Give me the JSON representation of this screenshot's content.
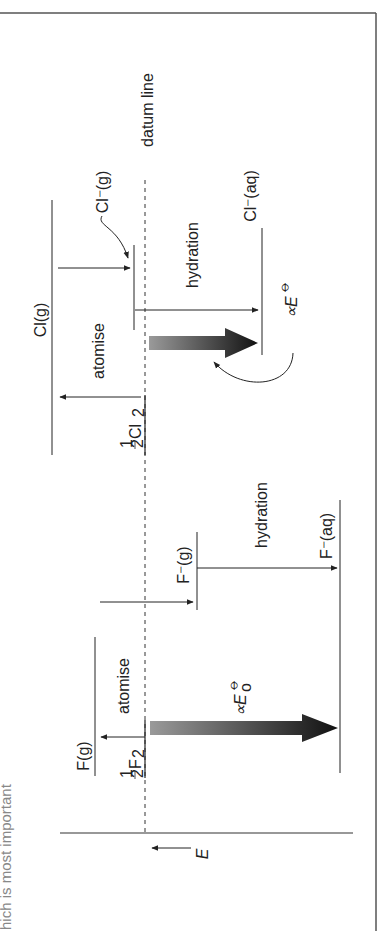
{
  "diagram": {
    "orientation": "rotated 90deg clockwise (energy axis horizontal, labels vertical)",
    "caption_fragment": "hich is most important",
    "axis": {
      "label": "E",
      "direction": "decreasing to the left"
    },
    "datum_label": "datum line",
    "chlorine": {
      "element_label": "½Cl₂",
      "element_main": "Cl",
      "element_sub": "2",
      "gas_atom": "Cl(g)",
      "gas_ion": "Cl⁻(g)",
      "aqueous_ion": "Cl⁻(aq)",
      "step_atomise": "atomise",
      "step_hydration": "hydration",
      "potential_label": "∝E",
      "potential_sup": "⦵"
    },
    "fluorine": {
      "element_label": "½F₂",
      "element_main": "F",
      "element_sub": "2",
      "gas_atom": "F(g)",
      "gas_ion": "F⁻(g)",
      "aqueous_ion": "F⁻(aq)",
      "step_atomise": "atomise",
      "step_hydration": "hydration",
      "potential_label": "∝E",
      "potential_sup": "⦵",
      "potential_sub": "o"
    },
    "half": "1",
    "half_den": "2",
    "colors": {
      "line": "#222222",
      "frame": "#555555",
      "arrow_start": "#9a9a9a",
      "arrow_end": "#111111"
    }
  }
}
